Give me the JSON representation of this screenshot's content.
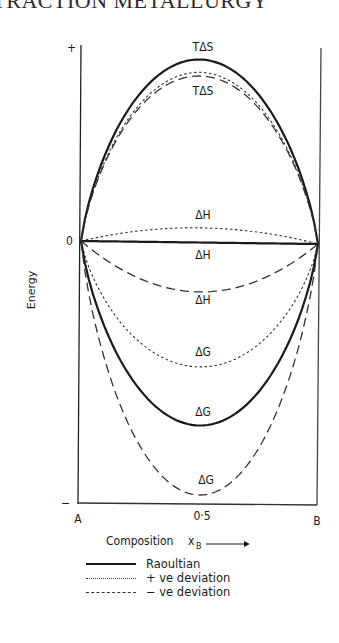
{
  "page": {
    "header": "EXTRACTION METALLURGY"
  },
  "chart_data": {
    "type": "line",
    "title": "",
    "xlabel": "Composition",
    "xlabel_symbol": "x",
    "xlabel_subscript": "B",
    "ylabel": "Energy",
    "x_ticks": [
      "A",
      "0·5",
      "B"
    ],
    "x": [
      0,
      0.5,
      1
    ],
    "y_markers": {
      "top": "+",
      "zero": "0",
      "bottom": "−"
    },
    "grid": false,
    "legend_position": "below",
    "legend": [
      {
        "label": "Raoultian",
        "style": "solid"
      },
      {
        "label": "+ ve deviation",
        "style": "dotted"
      },
      {
        "label": "− ve deviation",
        "style": "dashed"
      }
    ],
    "series": [
      {
        "name": "TΔS Raoultian",
        "quantity": "TΔS",
        "style": "solid",
        "extremum_rel": 1.0
      },
      {
        "name": "TΔS + ve deviation",
        "quantity": "TΔS",
        "style": "dotted",
        "extremum_rel": 0.93
      },
      {
        "name": "TΔS − ve deviation",
        "quantity": "TΔS",
        "style": "dashed",
        "extremum_rel": 0.91
      },
      {
        "name": "ΔH + ve deviation",
        "quantity": "ΔH",
        "style": "dotted",
        "extremum_rel": 0.08
      },
      {
        "name": "ΔH Raoultian",
        "quantity": "ΔH",
        "style": "solid",
        "extremum_rel": 0.0
      },
      {
        "name": "ΔH − ve deviation",
        "quantity": "ΔH",
        "style": "dashed",
        "extremum_rel": -0.27
      },
      {
        "name": "ΔG + ve deviation",
        "quantity": "ΔG",
        "style": "dotted",
        "extremum_rel": -0.68
      },
      {
        "name": "ΔG Raoultian",
        "quantity": "ΔG",
        "style": "solid",
        "extremum_rel": -1.0
      },
      {
        "name": "ΔG − ve deviation",
        "quantity": "ΔG",
        "style": "dashed",
        "extremum_rel": -1.38
      }
    ],
    "annotations": [
      {
        "text": "TΔS",
        "near": "TΔS Raoultian"
      },
      {
        "text": "TΔS",
        "near": "TΔS deviation curves"
      },
      {
        "text": "ΔH",
        "near": "ΔH + ve deviation"
      },
      {
        "text": "ΔH",
        "near": "ΔH Raoultian"
      },
      {
        "text": "ΔH",
        "near": "ΔH − ve deviation"
      },
      {
        "text": "ΔG",
        "near": "ΔG + ve deviation"
      },
      {
        "text": "ΔG",
        "near": "ΔG Raoultian"
      },
      {
        "text": "ΔG",
        "near": "ΔG − ve deviation"
      }
    ]
  }
}
